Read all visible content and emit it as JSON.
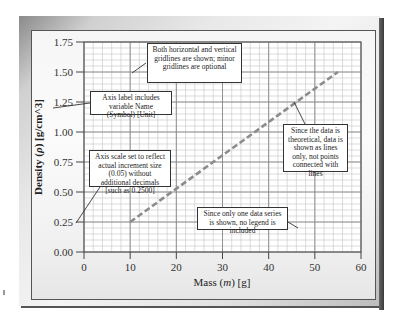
{
  "chart_data": {
    "type": "line",
    "title": "",
    "xlabel": "Mass (m) [g]",
    "ylabel": "Density (ρ) [g/cm^3]",
    "xlim": [
      0,
      60
    ],
    "ylim": [
      0,
      1.75
    ],
    "x_ticks": [
      0,
      10,
      20,
      30,
      40,
      50,
      60
    ],
    "y_ticks": [
      "0.00",
      "0.25",
      "0.50",
      "0.75",
      "1.00",
      "1.25",
      "1.50",
      "1.75"
    ],
    "grid": {
      "major": true,
      "minor": true,
      "x_minor_step": 2,
      "y_minor_step": 0.05
    },
    "legend": "none",
    "series": [
      {
        "name": "theoretical",
        "style": "dashed",
        "color": "#8c8c8c",
        "x": [
          10,
          55
        ],
        "y": [
          0.25,
          1.5
        ]
      }
    ],
    "annotations": [
      {
        "id": "gridlines",
        "text": "Both horizontal and vertical gridlines are shown; minor gridlines are optional"
      },
      {
        "id": "axis-label",
        "text": "Axis label includes variable Name (Symbol) [Unit]"
      },
      {
        "id": "axis-scale",
        "text": "Axis scale set to reflect actual increment size (0.05) without additional decimals [such as 0.2500]"
      },
      {
        "id": "theoretical",
        "text": "Since the data is theoretical, data is shown as lines only, not points connected with lines"
      },
      {
        "id": "legend",
        "text": "Since only one data series is shown, no legend is included"
      }
    ]
  },
  "axes": {
    "xlabel_prefix": "Mass (",
    "xlabel_symbol": "m",
    "xlabel_suffix": ") [g]",
    "ylabel_prefix": "Density (",
    "ylabel_symbol": "ρ",
    "ylabel_suffix": ") [g/cm^3]"
  },
  "annotations": {
    "gridlines": "Both horizontal and vertical gridlines are shown; minor gridlines are optional",
    "axis_label": "Axis label includes variable Name (Symbol) [Unit]",
    "axis_scale": "Axis scale set to reflect actual increment size (0.05) without additional decimals [such as 0.2500]",
    "theoretical": "Since the data is theoretical, data is shown as lines only, not points connected with lines",
    "legend": "Since only one data series is shown, no legend is included"
  }
}
